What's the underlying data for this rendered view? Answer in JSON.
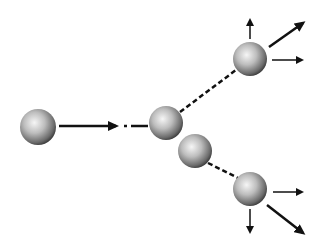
{
  "diagram": {
    "title": "",
    "colors": {
      "background": "#ffffff",
      "sphere_light": "#f4f4f4",
      "sphere_mid": "#a8a8a8",
      "sphere_dark": "#3a3a3a",
      "line": "#111111"
    },
    "spheres": [
      {
        "id": "incoming",
        "cx": 38,
        "cy": 127,
        "r": 18
      },
      {
        "id": "target-1",
        "cx": 166,
        "cy": 123,
        "r": 17
      },
      {
        "id": "target-2",
        "cx": 195,
        "cy": 151,
        "r": 17
      },
      {
        "id": "outgoing-upper",
        "cx": 250,
        "cy": 59,
        "r": 17
      },
      {
        "id": "outgoing-lower",
        "cx": 250,
        "cy": 189,
        "r": 17
      }
    ],
    "labels": []
  }
}
